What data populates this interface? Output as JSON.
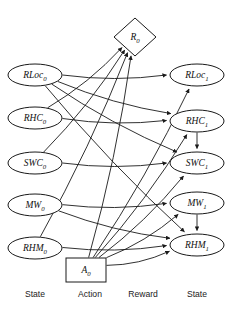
{
  "diagram": {
    "colors": {
      "background": "#ffffff",
      "stroke": "#1a1a1a",
      "node_fill": "#ffffff",
      "text": "#111111"
    },
    "nodes": [
      {
        "id": "RLoc0",
        "base": "RLoc",
        "sub": "0",
        "shape": "ellipse",
        "cx": 35,
        "cy": 75,
        "rx": 27,
        "ry": 11
      },
      {
        "id": "RHC0",
        "base": "RHC",
        "sub": "0",
        "shape": "ellipse",
        "cx": 35,
        "cy": 118,
        "rx": 27,
        "ry": 11
      },
      {
        "id": "SWC0",
        "base": "SWC",
        "sub": "0",
        "shape": "ellipse",
        "cx": 35,
        "cy": 163,
        "rx": 27,
        "ry": 11
      },
      {
        "id": "MW0",
        "base": "MW",
        "sub": "0",
        "shape": "ellipse",
        "cx": 35,
        "cy": 205,
        "rx": 27,
        "ry": 11
      },
      {
        "id": "RHM0",
        "base": "RHM",
        "sub": "0",
        "shape": "ellipse",
        "cx": 35,
        "cy": 248,
        "rx": 27,
        "ry": 11
      },
      {
        "id": "A0",
        "base": "A",
        "sub": "0",
        "shape": "rect",
        "cx": 86,
        "cy": 270,
        "rx": 20,
        "ry": 12
      },
      {
        "id": "R0",
        "base": "R",
        "sub": "0",
        "shape": "diamond",
        "cx": 135,
        "cy": 37,
        "rx": 21,
        "ry": 19
      },
      {
        "id": "RLoc1",
        "base": "RLoc",
        "sub": "1",
        "shape": "ellipse",
        "cx": 197,
        "cy": 75,
        "rx": 27,
        "ry": 11
      },
      {
        "id": "RHC1",
        "base": "RHC",
        "sub": "1",
        "shape": "ellipse",
        "cx": 197,
        "cy": 121,
        "rx": 27,
        "ry": 11
      },
      {
        "id": "SWC1",
        "base": "SWC",
        "sub": "1",
        "shape": "ellipse",
        "cx": 197,
        "cy": 163,
        "rx": 27,
        "ry": 11
      },
      {
        "id": "MW1",
        "base": "MW",
        "sub": "1",
        "shape": "ellipse",
        "cx": 197,
        "cy": 203,
        "rx": 27,
        "ry": 11
      },
      {
        "id": "RHM1",
        "base": "RHM",
        "sub": "1",
        "shape": "ellipse",
        "cx": 197,
        "cy": 245,
        "rx": 27,
        "ry": 11
      }
    ],
    "edges": [
      {
        "from": "RLoc0",
        "to": "RLoc1"
      },
      {
        "from": "RLoc0",
        "to": "RHC1"
      },
      {
        "from": "RLoc0",
        "to": "SWC1"
      },
      {
        "from": "RLoc0",
        "to": "RHM1"
      },
      {
        "from": "RHC0",
        "to": "RHC1"
      },
      {
        "from": "RHC0",
        "to": "R0"
      },
      {
        "from": "SWC0",
        "to": "SWC1"
      },
      {
        "from": "SWC0",
        "to": "R0"
      },
      {
        "from": "MW0",
        "to": "MW1"
      },
      {
        "from": "MW0",
        "to": "RHM1"
      },
      {
        "from": "RHM0",
        "to": "RHM1"
      },
      {
        "from": "RHM0",
        "to": "R0"
      },
      {
        "from": "A0",
        "to": "RLoc1"
      },
      {
        "from": "A0",
        "to": "RHC1"
      },
      {
        "from": "A0",
        "to": "SWC1"
      },
      {
        "from": "A0",
        "to": "MW1"
      },
      {
        "from": "A0",
        "to": "RHM1"
      },
      {
        "from": "A0",
        "to": "R0"
      },
      {
        "from": "RHC1",
        "to": "SWC1"
      },
      {
        "from": "MW1",
        "to": "RHM1"
      }
    ],
    "column_labels": [
      {
        "text": "State",
        "x": 35,
        "y": 295
      },
      {
        "text": "Action",
        "x": 90,
        "y": 295
      },
      {
        "text": "Reward",
        "x": 143,
        "y": 295
      },
      {
        "text": "State",
        "x": 197,
        "y": 295
      }
    ]
  }
}
